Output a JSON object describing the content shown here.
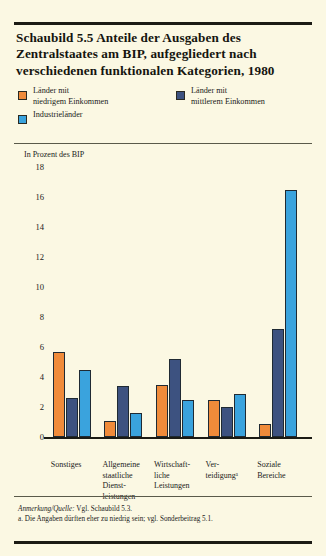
{
  "figure": {
    "title": "Schaubild 5.5  Anteile der Ausgaben des Zentralstaates am BIP, aufgegliedert nach verschiedenen funktionalen Kategorien, 1980",
    "axis_caption": "In Prozent des BIP"
  },
  "legend": {
    "items": [
      {
        "label": "Länder mit\nniedrigem Einkommen",
        "color": "#f08b3a"
      },
      {
        "label": "Länder mit\nmittlerem Einkommen",
        "color": "#3d5280"
      },
      {
        "label": "Industrieländer",
        "color": "#3aa3dd"
      }
    ]
  },
  "notes": {
    "source_label": "Anmerkung/Quelle:",
    "source_text": " Vgl. Schaubild 5.3.",
    "footnote_a": "a. Die Angaben dürften eher zu niedrig sein; vgl. Sonderbeitrag 5.1."
  },
  "chart_data": {
    "type": "bar",
    "title": "Schaubild 5.5  Anteile der Ausgaben des Zentralstaates am BIP, aufgegliedert nach verschiedenen funktionalen Kategorien, 1980",
    "xlabel": "",
    "ylabel": "In Prozent des BIP",
    "ylim": [
      0,
      18
    ],
    "yticks": [
      0,
      2,
      4,
      6,
      8,
      10,
      12,
      14,
      16,
      18
    ],
    "grid": false,
    "legend_position": "top",
    "categories": [
      "Sonstiges",
      "Allgemeine\nstaatliche\nDienst-\nleistungen",
      "Wirtschaft-\nliche\nLeistungen",
      "Ver-\nteidigungᵃ",
      "Soziale\nBereiche"
    ],
    "series": [
      {
        "name": "Länder mit niedrigem Einkommen",
        "color": "#f08b3a",
        "values": [
          5.7,
          1.1,
          3.5,
          2.5,
          0.9
        ]
      },
      {
        "name": "Länder mit mittlerem Einkommen",
        "color": "#3d5280",
        "values": [
          2.6,
          3.4,
          5.2,
          2.0,
          7.2
        ]
      },
      {
        "name": "Industrieländer",
        "color": "#3aa3dd",
        "values": [
          4.5,
          1.6,
          2.5,
          2.9,
          16.5
        ]
      }
    ]
  }
}
